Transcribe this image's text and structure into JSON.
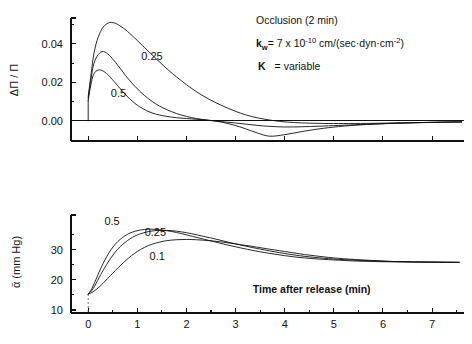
{
  "annotations": {
    "occlusion": "Occlusion (2 min)",
    "kw_symbol": "k",
    "kw_subscript": "w",
    "kw_equals": "= 7 x 10",
    "kw_exponent": "-10",
    "kw_units": " cm/(sec·dyn·cm",
    "kw_units_exp": "-2",
    "kw_units_close": ")",
    "k_symbol": "K",
    "k_value": "= variable"
  },
  "chart_data": [
    {
      "type": "line",
      "id": "top-panel",
      "title": "",
      "xlabel": "",
      "ylabel": "ΔΠ / Π",
      "xlim": [
        -0.35,
        7.65
      ],
      "ylim": [
        -0.0105,
        0.0535
      ],
      "grid": false,
      "legend": "inline-curve-labels",
      "xticks": [
        0,
        1,
        2,
        3,
        4,
        5,
        6,
        7
      ],
      "xticklabels": [
        "",
        "",
        "",
        "",
        "",
        "",
        "",
        ""
      ],
      "yticks": [
        0.0,
        0.02,
        0.04
      ],
      "yticklabels": [
        "0.00",
        "0.02",
        "0.04"
      ],
      "yminorticks": [
        0.01,
        0.03,
        0.05
      ],
      "series": [
        {
          "name": "0.1",
          "label": "",
          "x": [
            0.0,
            0.03,
            0.07,
            0.1,
            0.14,
            0.18,
            0.23,
            0.28,
            0.33,
            0.4,
            0.47,
            0.55,
            0.63,
            0.72,
            0.8,
            0.9,
            1.0,
            1.1,
            1.2,
            1.35,
            1.5,
            1.65,
            1.8,
            2.0,
            2.2,
            2.4,
            2.6,
            2.85,
            3.1,
            3.35,
            3.6,
            3.9,
            4.2,
            4.5,
            4.9,
            5.3,
            5.8,
            6.3,
            6.8,
            7.3,
            7.6
          ],
          "y": [
            0.0125,
            0.0185,
            0.0265,
            0.0325,
            0.0378,
            0.0418,
            0.0452,
            0.0478,
            0.0495,
            0.0508,
            0.0512,
            0.0508,
            0.0497,
            0.0482,
            0.0465,
            0.0442,
            0.0418,
            0.0393,
            0.0368,
            0.0331,
            0.0295,
            0.026,
            0.0228,
            0.0188,
            0.0152,
            0.0121,
            0.0094,
            0.0065,
            0.004,
            0.0021,
            0.0008,
            -0.0003,
            -0.0009,
            -0.0012,
            -0.0014,
            -0.0014,
            -0.0013,
            -0.0011,
            -0.0009,
            -0.0007,
            -0.0006
          ]
        },
        {
          "name": "0.25",
          "label": "0.25",
          "x": [
            0.0,
            0.03,
            0.07,
            0.1,
            0.14,
            0.18,
            0.23,
            0.28,
            0.34,
            0.4,
            0.46,
            0.52,
            0.6,
            0.68,
            0.76,
            0.85,
            0.95,
            1.05,
            1.15,
            1.3,
            1.45,
            1.6,
            1.8,
            2.0,
            2.2,
            2.45,
            2.7,
            2.95,
            3.2,
            3.45,
            3.7,
            4.0,
            4.35,
            4.7,
            5.1,
            5.6,
            6.1,
            6.6,
            7.1,
            7.6
          ],
          "y": [
            0.0115,
            0.0172,
            0.0238,
            0.0282,
            0.0315,
            0.0336,
            0.0352,
            0.036,
            0.0358,
            0.0348,
            0.0333,
            0.0315,
            0.029,
            0.0263,
            0.0236,
            0.0208,
            0.018,
            0.0154,
            0.0131,
            0.0101,
            0.0077,
            0.0058,
            0.0038,
            0.0023,
            0.0012,
            0.0003,
            -0.0004,
            -0.001,
            -0.0017,
            -0.0024,
            -0.0029,
            -0.0032,
            -0.0031,
            -0.0028,
            -0.0024,
            -0.0019,
            -0.0014,
            -0.001,
            -0.0008,
            -0.0006
          ]
        },
        {
          "name": "0.5",
          "label": "0.5",
          "x": [
            0.0,
            0.03,
            0.07,
            0.1,
            0.14,
            0.18,
            0.23,
            0.28,
            0.34,
            0.4,
            0.46,
            0.53,
            0.6,
            0.68,
            0.76,
            0.85,
            0.95,
            1.05,
            1.18,
            1.3,
            1.45,
            1.6,
            1.8,
            2.0,
            2.2,
            2.45,
            2.7,
            2.95,
            3.2,
            3.45,
            3.7,
            4.0,
            4.35,
            4.7,
            5.1,
            5.6,
            6.1,
            6.6,
            7.1,
            7.6
          ],
          "y": [
            0.0105,
            0.0155,
            0.0205,
            0.0235,
            0.0253,
            0.0262,
            0.0265,
            0.0262,
            0.0253,
            0.024,
            0.0224,
            0.0204,
            0.0183,
            0.0159,
            0.0136,
            0.0113,
            0.0091,
            0.0073,
            0.0054,
            0.0041,
            0.003,
            0.0023,
            0.0016,
            0.0012,
            0.0008,
            0.0003,
            -0.0006,
            -0.0021,
            -0.0041,
            -0.0064,
            -0.008,
            -0.0072,
            -0.0056,
            -0.0042,
            -0.003,
            -0.002,
            -0.0014,
            -0.001,
            -0.0007,
            -0.0005
          ]
        }
      ],
      "curve_labels": [
        {
          "text": "0.25",
          "x": 1.08,
          "y": 0.0315
        },
        {
          "text": "0.5",
          "x": 0.46,
          "y": 0.0122
        }
      ]
    },
    {
      "type": "line",
      "id": "bottom-panel",
      "title": "",
      "xlabel": "Time after release (min)",
      "ylabel": "ᾱ (mm Hg)",
      "xlim": [
        -0.35,
        7.65
      ],
      "ylim": [
        9.0,
        41.5
      ],
      "grid": false,
      "legend": "inline-curve-labels",
      "xticks": [
        0,
        1,
        2,
        3,
        4,
        5,
        6,
        7
      ],
      "xticklabels": [
        "0",
        "1",
        "2",
        "3",
        "4",
        "5",
        "6",
        "7"
      ],
      "xminorticks": [
        0.5,
        1.5,
        2.5,
        3.5,
        4.5,
        5.5,
        6.5,
        7.5
      ],
      "yticks": [
        10,
        20,
        30
      ],
      "yticklabels": [
        "10",
        "20",
        "30"
      ],
      "yminorticks": [
        15,
        25,
        35
      ],
      "series": [
        {
          "name": "0.5",
          "label": "0.5",
          "x": [
            0.0,
            0.05,
            0.1,
            0.16,
            0.22,
            0.3,
            0.38,
            0.46,
            0.55,
            0.65,
            0.75,
            0.85,
            0.95,
            1.05,
            1.15,
            1.3,
            1.45,
            1.6,
            1.8,
            2.0,
            2.25,
            2.5,
            2.8,
            3.1,
            3.4,
            3.8,
            4.2,
            4.6,
            5.0,
            5.5,
            6.0,
            6.5,
            7.0,
            7.55
          ],
          "y": [
            15.3,
            16.4,
            18.0,
            20.2,
            22.5,
            25.3,
            27.8,
            29.9,
            31.8,
            33.4,
            34.6,
            35.5,
            36.1,
            36.5,
            36.7,
            36.8,
            36.6,
            36.3,
            35.7,
            34.9,
            33.9,
            32.9,
            31.7,
            30.6,
            29.6,
            28.5,
            27.6,
            27.0,
            26.6,
            26.2,
            26.0,
            25.9,
            25.85,
            25.8
          ]
        },
        {
          "name": "0.25",
          "label": "0.25",
          "x": [
            0.0,
            0.05,
            0.1,
            0.16,
            0.22,
            0.3,
            0.38,
            0.46,
            0.55,
            0.65,
            0.75,
            0.85,
            0.95,
            1.05,
            1.2,
            1.35,
            1.5,
            1.7,
            1.9,
            2.1,
            2.35,
            2.6,
            2.9,
            3.2,
            3.5,
            3.9,
            4.3,
            4.7,
            5.1,
            5.6,
            6.1,
            6.6,
            7.1,
            7.55
          ],
          "y": [
            15.3,
            16.0,
            17.1,
            18.8,
            20.7,
            23.0,
            25.2,
            27.2,
            29.2,
            31.0,
            32.4,
            33.6,
            34.5,
            35.2,
            35.9,
            36.3,
            36.4,
            36.3,
            35.9,
            35.3,
            34.4,
            33.5,
            32.3,
            31.2,
            30.2,
            29.0,
            28.0,
            27.3,
            26.8,
            26.4,
            26.1,
            25.95,
            25.85,
            25.8
          ]
        },
        {
          "name": "0.1",
          "label": "0.1",
          "x": [
            0.0,
            0.05,
            0.12,
            0.2,
            0.3,
            0.4,
            0.5,
            0.62,
            0.75,
            0.88,
            1.0,
            1.15,
            1.3,
            1.45,
            1.6,
            1.8,
            2.0,
            2.2,
            2.45,
            2.7,
            3.0,
            3.3,
            3.6,
            4.0,
            4.4,
            4.8,
            5.2,
            5.7,
            6.2,
            6.7,
            7.2,
            7.55
          ],
          "y": [
            15.3,
            15.6,
            16.3,
            17.3,
            18.8,
            20.5,
            22.2,
            24.2,
            26.2,
            28.0,
            29.4,
            30.8,
            31.8,
            32.5,
            33.0,
            33.3,
            33.4,
            33.3,
            33.0,
            32.6,
            31.9,
            31.2,
            30.4,
            29.4,
            28.4,
            27.6,
            27.0,
            26.5,
            26.1,
            25.95,
            25.85,
            25.8
          ]
        }
      ],
      "curve_labels": [
        {
          "text": "0.5",
          "x": 0.33,
          "y": 38.2
        },
        {
          "text": "0.25",
          "x": 1.15,
          "y": 34.6
        },
        {
          "text": "0.1",
          "x": 1.25,
          "y": 26.5
        }
      ]
    }
  ]
}
